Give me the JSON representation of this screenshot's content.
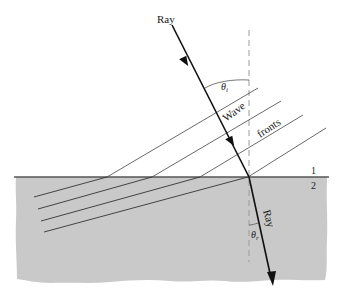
{
  "diagram": {
    "labels": {
      "incident_ray": "Ray",
      "refracted_ray": "Ray",
      "wave": "Wave",
      "fronts": "fronts",
      "medium_1": "1",
      "medium_2": "2",
      "theta_incident_symbol": "θ",
      "theta_incident_subscript": "i",
      "theta_refracted_symbol": "θ",
      "theta_refracted_subscript": "r"
    },
    "colors": {
      "medium_2_fill": "#c9c9c9",
      "surface_line": "#555555",
      "ray": "#111111",
      "wavefront": "#444444",
      "normal": "#9a9a9a",
      "background": "#ffffff"
    },
    "geometry": {
      "interface_y": 177,
      "normal_x": 249,
      "incident_ray": {
        "x1": 172,
        "y1": 25,
        "x2": 249,
        "y2": 177
      },
      "refracted_ray": {
        "x1": 249,
        "y1": 177,
        "x2": 272,
        "y2": 284
      },
      "wavefronts_medium1": [
        {
          "x1": 107,
          "y1": 177,
          "x2": 258,
          "y2": 88
        },
        {
          "x1": 152,
          "y1": 177,
          "x2": 281,
          "y2": 101
        },
        {
          "x1": 200,
          "y1": 177,
          "x2": 303,
          "y2": 115
        },
        {
          "x1": 248,
          "y1": 177,
          "x2": 326,
          "y2": 128
        }
      ],
      "wavefronts_medium2": [
        {
          "x1": 34,
          "y1": 197,
          "x2": 107,
          "y2": 177
        },
        {
          "x1": 38,
          "y1": 209,
          "x2": 152,
          "y2": 177
        },
        {
          "x1": 41,
          "y1": 221,
          "x2": 200,
          "y2": 177
        },
        {
          "x1": 44,
          "y1": 232,
          "x2": 248,
          "y2": 177
        }
      ]
    }
  }
}
